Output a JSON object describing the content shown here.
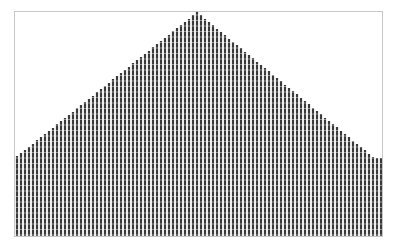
{
  "chart_data": {
    "type": "bar",
    "title": "",
    "xlabel": "",
    "ylabel": "",
    "grid": true,
    "legend": null,
    "ylim": [
      0,
      225
    ],
    "n_bars": 92,
    "shape": "triangular (linear rise to center peak, linear fall)",
    "left_value": 80,
    "peak_value": 224,
    "right_value": 78,
    "peak_index": 45,
    "values": [
      80,
      83,
      86,
      89,
      92,
      96,
      99,
      102,
      105,
      108,
      112,
      115,
      118,
      121,
      124,
      128,
      131,
      134,
      137,
      140,
      144,
      147,
      150,
      153,
      157,
      160,
      163,
      166,
      169,
      173,
      176,
      179,
      182,
      185,
      189,
      192,
      195,
      198,
      201,
      205,
      208,
      211,
      214,
      217,
      221,
      224,
      221,
      217,
      214,
      211,
      207,
      204,
      201,
      197,
      194,
      191,
      188,
      184,
      181,
      178,
      174,
      171,
      168,
      165,
      161,
      158,
      155,
      151,
      148,
      145,
      142,
      138,
      135,
      132,
      128,
      125,
      122,
      118,
      115,
      112,
      109,
      105,
      102,
      99,
      95,
      92,
      89,
      86,
      82,
      79,
      78,
      78
    ],
    "colors": {
      "bar": "#3a3a3a",
      "frame": "#c8c8c8",
      "background": "#ffffff"
    }
  },
  "plot_area": {
    "x": 14,
    "y": 11,
    "width": 368,
    "height": 225
  }
}
